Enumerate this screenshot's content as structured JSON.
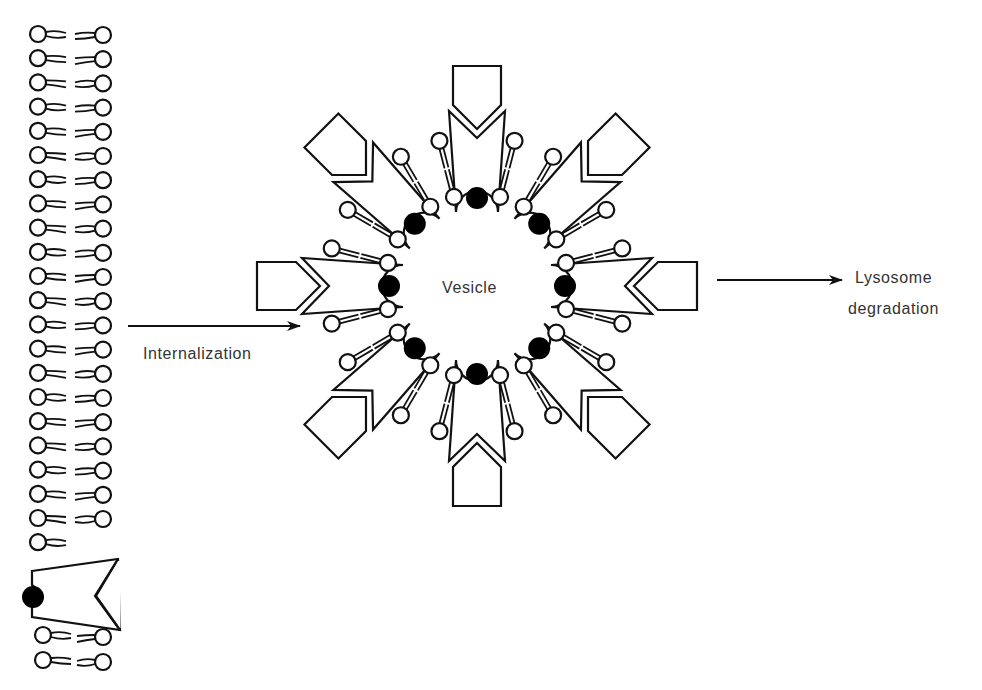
{
  "labels": {
    "internalization": "Internalization",
    "vesicle": "Vesicle",
    "lysosome": "Lysosome",
    "degradation": "degradation"
  },
  "colors": {
    "stroke": "#111111",
    "ligand_fill": "#000000",
    "background": "#ffffff",
    "text": "#333333"
  },
  "membrane": {
    "left_head_x": 38,
    "right_head_x": 103,
    "head_radius": 8,
    "row_y_start": 34,
    "row_spacing": 24.2,
    "rows_above_receptor": 22,
    "receptor": {
      "ligand_x": 33,
      "ligand_y": 597
    },
    "rows_below_receptor_y": [
      635,
      660
    ]
  },
  "vesicle": {
    "center_x": 477,
    "center_y": 286,
    "receptor_count": 8,
    "receptor_angles_deg": [
      -90,
      -45,
      0,
      45,
      90,
      135,
      180,
      225
    ]
  },
  "arrows": [
    {
      "name": "internalization-arrow",
      "x1": 128,
      "y1": 326,
      "x2": 300,
      "y2": 326
    },
    {
      "name": "lysosome-arrow",
      "x1": 717,
      "y1": 280,
      "x2": 842,
      "y2": 280
    }
  ]
}
